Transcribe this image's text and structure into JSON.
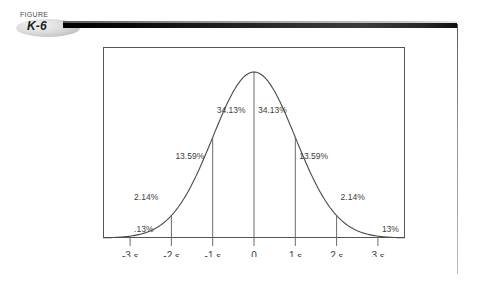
{
  "figure": {
    "caption_word": "FIGURE",
    "number": "K-6"
  },
  "chart_data": {
    "type": "area",
    "title": "",
    "subtitle": "",
    "xlabel": "",
    "ylabel": "",
    "grid": false,
    "legend": "none",
    "xlim": [
      -3.5,
      3.5
    ],
    "ylim": [
      0,
      1
    ],
    "x_tick_values": [
      -3,
      -2,
      -1,
      0,
      1,
      2,
      3
    ],
    "x_tick_labels": [
      "-3 s",
      "-2 s",
      "-1 s",
      "0",
      "1 s",
      "2 s",
      "3 s"
    ],
    "x_tick_numbers": [
      "-3",
      "-2",
      "-1",
      "0",
      "1",
      "2",
      "3"
    ],
    "x_tick_units": [
      "s",
      "s",
      "s",
      "",
      "s",
      "s",
      "s"
    ],
    "bands": [
      {
        "from": -3,
        "to": -2,
        "label": ".13%",
        "value": 0.13
      },
      {
        "from": -2,
        "to": -1,
        "label": "2.14%",
        "value": 2.14
      },
      {
        "from": -1,
        "to": 0,
        "label": "13.59%",
        "value": 13.59
      },
      {
        "from": 0,
        "to": 1,
        "label": "34.13%",
        "value": 34.13
      },
      {
        "from": 1,
        "to": 2,
        "label": "34.13%",
        "value": 34.13
      },
      {
        "from": 2,
        "to": 3,
        "label": "13.59%",
        "value": 13.59
      },
      {
        "from": 3,
        "to": 4,
        "label": "2.14%",
        "value": 2.14
      },
      {
        "from": 4,
        "to": 5,
        "label": "13%",
        "value": 0.13
      }
    ],
    "band_labels": [
      ".13%",
      "2.14%",
      "13.59%",
      "34.13%",
      "34.13%",
      "13.59%",
      "2.14%",
      "13%"
    ],
    "curve_color": "#4a4a4a",
    "frame_color": "#555555",
    "divider_color": "#6b6b6b"
  },
  "colors": {
    "rule_dark": "#000000",
    "rule_fade": "#3c3c3c",
    "text": "#3a3a3a",
    "background": "#ffffff"
  }
}
